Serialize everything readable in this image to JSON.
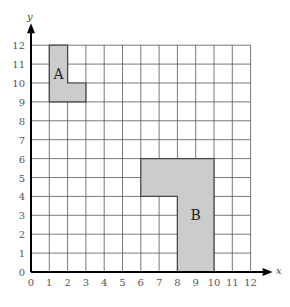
{
  "chart_data": {
    "type": "diagram",
    "title": "",
    "xlabel": "x",
    "ylabel": "y",
    "xlim": [
      0,
      12
    ],
    "ylim": [
      0,
      12
    ],
    "grid": true,
    "x_ticks": [
      "0",
      "1",
      "2",
      "3",
      "4",
      "5",
      "6",
      "7",
      "8",
      "9",
      "10",
      "11",
      "12"
    ],
    "y_ticks": [
      "0",
      "1",
      "2",
      "3",
      "4",
      "5",
      "6",
      "7",
      "8",
      "9",
      "10",
      "11",
      "12"
    ],
    "shapes": [
      {
        "label": "A",
        "vertices": [
          [
            1,
            12
          ],
          [
            2,
            12
          ],
          [
            2,
            10
          ],
          [
            3,
            10
          ],
          [
            3,
            9
          ],
          [
            1,
            9
          ]
        ],
        "label_pos": [
          1.5,
          10.5
        ],
        "fill": "#cccccc"
      },
      {
        "label": "B",
        "vertices": [
          [
            6,
            6
          ],
          [
            10,
            6
          ],
          [
            10,
            0
          ],
          [
            8,
            0
          ],
          [
            8,
            4
          ],
          [
            6,
            4
          ]
        ],
        "label_pos": [
          9,
          3
        ],
        "fill": "#cccccc"
      }
    ]
  },
  "axis": {
    "x_label": "x",
    "y_label": "y"
  },
  "shape_labels": {
    "a": "A",
    "b": "B"
  }
}
